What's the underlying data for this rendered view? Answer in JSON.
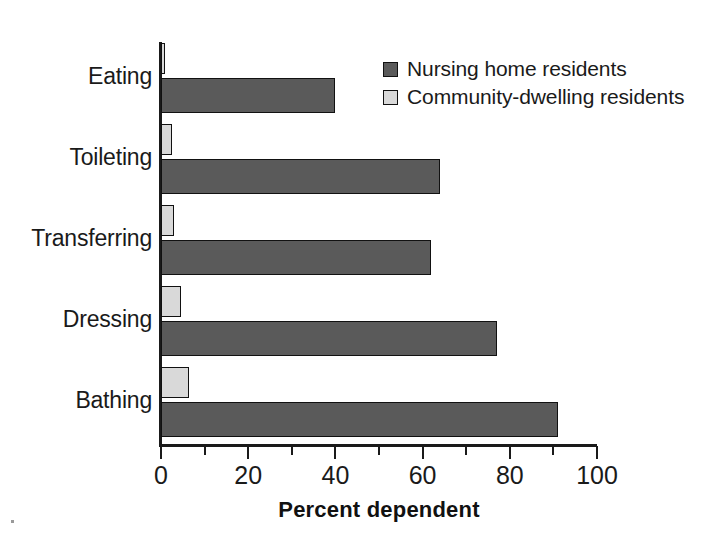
{
  "chart_data": {
    "type": "bar",
    "orientation": "horizontal",
    "title": "",
    "subtitle": "",
    "xlabel": "Percent dependent",
    "ylabel": "",
    "categories": [
      "Eating",
      "Toileting",
      "Transferring",
      "Dressing",
      "Bathing"
    ],
    "series": [
      {
        "name": "Nursing home residents",
        "color": "#5a5a5a",
        "values": [
          40,
          64,
          62,
          77,
          91
        ]
      },
      {
        "name": "Community-dwelling residents",
        "color": "#d9d9d9",
        "values": [
          1,
          2.5,
          3,
          4.5,
          6.5
        ]
      }
    ],
    "xlim": [
      0,
      100
    ],
    "xticks": [
      0,
      20,
      40,
      60,
      80,
      100
    ],
    "xtick_labels": [
      "0",
      "20",
      "40",
      "60",
      "80",
      "100"
    ],
    "minor_xticks": [
      10,
      30,
      50,
      70,
      90
    ],
    "grid": false,
    "legend_position": "top-right"
  },
  "axis": {
    "x_title": "Percent dependent",
    "tick_labels": [
      "0",
      "20",
      "40",
      "60",
      "80",
      "100"
    ]
  },
  "categories": [
    {
      "label": "Eating"
    },
    {
      "label": "Toileting"
    },
    {
      "label": "Transferring"
    },
    {
      "label": "Dressing"
    },
    {
      "label": "Bathing"
    }
  ],
  "legend": {
    "items": [
      {
        "label": "Nursing home residents",
        "swatch": "dark-gray-swatch-icon"
      },
      {
        "label": "Community-dwelling residents",
        "swatch": "light-gray-swatch-icon"
      }
    ]
  }
}
